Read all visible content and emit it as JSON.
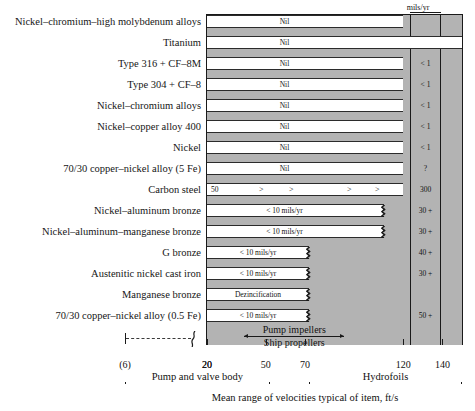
{
  "chart_data": {
    "type": "bar",
    "title": "",
    "xlabel": "Mean range of velocities typical of item, ft/s",
    "ylabel": "",
    "value_column_header": "mils/yr",
    "x_ticks": [
      6,
      20,
      50,
      70,
      120,
      140
    ],
    "x_tick_labels": [
      "(6)",
      "20",
      "50",
      "70",
      "120",
      "140"
    ],
    "xlim": [
      20,
      150
    ],
    "axis_break_after": "(6)",
    "grid": false,
    "categories": [
      "Nickel–chromium–high molybdenum alloys",
      "Titanium",
      "Type 316 + CF–8M",
      "Type 304 + CF–8",
      "Nickel–chromium alloys",
      "Nickel–copper alloy 400",
      "Nickel",
      "70/30 copper–nickel alloy (5 Fe)",
      "Carbon steel",
      "Nickel–aluminum bronze",
      "Nickel–aluminum–manganese bronze",
      "G bronze",
      "Austenitic nickel cast iron",
      "Manganese bronze",
      "70/30 copper–nickel alloy (0.5 Fe)"
    ],
    "series": [
      {
        "name": "Corrosion rate band",
        "rows": [
          {
            "label": "Nickel–chromium–high molybdenum alloys",
            "bar_text": "Nil",
            "bar_end": 120,
            "broken_end": false,
            "value": "",
            "value2": ""
          },
          {
            "label": "Titanium",
            "bar_text": "Nil",
            "bar_end": 150,
            "broken_end": false,
            "value": "",
            "value2": ""
          },
          {
            "label": "Type 316 + CF–8M",
            "bar_text": "Nil",
            "bar_end": 120,
            "broken_end": false,
            "value": "< 1",
            "value2": ""
          },
          {
            "label": "Type 304 + CF–8",
            "bar_text": "Nil",
            "bar_end": 120,
            "broken_end": false,
            "value": "< 1",
            "value2": ""
          },
          {
            "label": "Nickel–chromium alloys",
            "bar_text": "Nil",
            "bar_end": 120,
            "broken_end": false,
            "value": "< 1",
            "value2": ""
          },
          {
            "label": "Nickel–copper alloy 400",
            "bar_text": "Nil",
            "bar_end": 120,
            "broken_end": false,
            "value": "< 1",
            "value2": ""
          },
          {
            "label": "Nickel",
            "bar_text": "Nil",
            "bar_end": 120,
            "broken_end": false,
            "value": "< 1",
            "value2": ""
          },
          {
            "label": "70/30 copper–nickel alloy (5 Fe)",
            "bar_text": "Nil",
            "bar_end": 120,
            "broken_end": false,
            "value": "?",
            "value2": ""
          },
          {
            "label": "Carbon steel",
            "bar_text": "50",
            "bar_end": 120,
            "broken_end": false,
            "value": "300",
            "value2": "",
            "gt_marks": 4
          },
          {
            "label": "Nickel–aluminum bronze",
            "bar_text": "< 10 mils/yr",
            "bar_end": 110,
            "broken_end": true,
            "value": "30 +",
            "value2": ""
          },
          {
            "label": "Nickel–aluminum–manganese bronze",
            "bar_text": "< 10 mils/yr",
            "bar_end": 110,
            "broken_end": true,
            "value": "30 +",
            "value2": ""
          },
          {
            "label": "G bronze",
            "bar_text": "< 10 mils/yr",
            "bar_end": 72,
            "broken_end": true,
            "value": "40 +",
            "value2": ""
          },
          {
            "label": "Austenitic nickel cast iron",
            "bar_text": "< 10 mils/yr",
            "bar_end": 72,
            "broken_end": true,
            "value": "30 +",
            "value2": ""
          },
          {
            "label": "Manganese bronze",
            "bar_text": "Dezincification",
            "bar_end": 72,
            "broken_end": true,
            "value": "",
            "value2": ""
          },
          {
            "label": "70/30 copper–nickel alloy (0.5 Fe)",
            "bar_text": "< 10 mils/yr",
            "bar_end": 72,
            "broken_end": true,
            "value": "50 +",
            "value2": ""
          }
        ]
      }
    ],
    "annotations": [
      {
        "text": "Pump impellers",
        "from": 39,
        "to": 90
      },
      {
        "text": "Ship propellers",
        "from": 39,
        "to": 90
      }
    ],
    "ranges": [
      {
        "text": "Pump and valve body",
        "from": 6,
        "to": 52
      },
      {
        "text": "Hydrofoils",
        "from": 72,
        "to": 145
      }
    ],
    "colors": {
      "band_fill": "#b3b3b3",
      "bar_fill": "#ffffff",
      "rule": "#1a1a1a"
    }
  },
  "caption": "Mean range of velocities typical of item, ft/s",
  "header": {
    "units": "mils/yr"
  }
}
